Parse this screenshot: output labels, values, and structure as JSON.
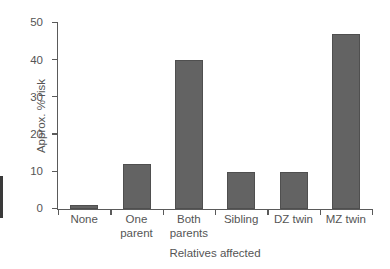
{
  "chart_data": {
    "type": "bar",
    "title": "",
    "xlabel": "Relatives affected",
    "ylabel": "Approx. % risk",
    "categories": [
      "None",
      "One parent",
      "Both parents",
      "Sibling",
      "DZ twin",
      "MZ twin"
    ],
    "category_lines": [
      [
        "None"
      ],
      [
        "One",
        "parent"
      ],
      [
        "Both",
        "parents"
      ],
      [
        "Sibling"
      ],
      [
        "DZ twin"
      ],
      [
        "MZ twin"
      ]
    ],
    "values": [
      1,
      12,
      40,
      10,
      10,
      47
    ],
    "ylim": [
      0,
      50
    ],
    "yticks": [
      0,
      10,
      20,
      30,
      40,
      50
    ],
    "ytick_labels": [
      "0",
      "10",
      "20",
      "30",
      "40",
      "50"
    ],
    "grid": false,
    "legend": null,
    "bar_color": "#636363",
    "axis_color": "#5a5a5a",
    "text_color": "#555555"
  }
}
